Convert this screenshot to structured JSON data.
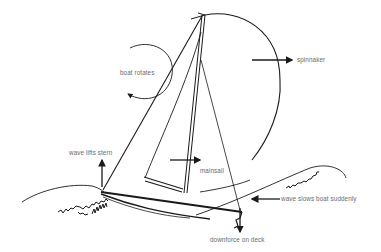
{
  "diagram": {
    "colors": {
      "background": "#ffffff",
      "stroke": "#1a1a1a",
      "label_text": "#6a6a6a"
    },
    "labels": {
      "boat_rotates": "boat rotates",
      "spinnaker": "spinnaker",
      "wave_lifts_stern": "wave lifts stern",
      "mainsail": "mainsail",
      "wave_slows_boat": "wave slows boat suddenly",
      "downforce_on_deck": "downforce on deck"
    },
    "label_positions": {
      "boat_rotates": [
        120,
        70
      ],
      "spinnaker": [
        297,
        57
      ],
      "wave_lifts_stern": [
        69,
        150
      ],
      "mainsail": [
        200,
        168
      ],
      "wave_slows_boat": [
        281,
        196
      ],
      "downforce_on_deck": [
        210,
        237
      ]
    }
  }
}
